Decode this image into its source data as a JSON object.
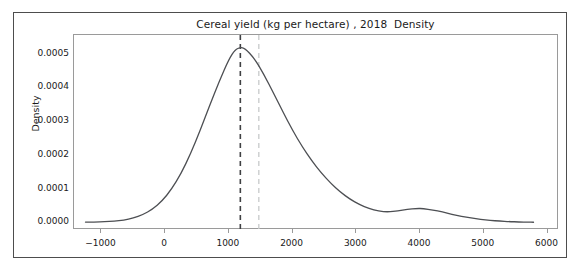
{
  "chart_data": {
    "type": "line",
    "title": "Cereal yield (kg per hectare) , 2018  Density",
    "xlabel": "",
    "ylabel": "Density",
    "grid": false,
    "legend": null,
    "xlim": [
      -1430,
      6180
    ],
    "ylim": [
      -2.15e-05,
      0.000557
    ],
    "xticks": [
      -1000,
      0,
      1000,
      2000,
      3000,
      4000,
      5000,
      6000
    ],
    "xtick_labels": [
      "−1000",
      "0",
      "1000",
      "2000",
      "3000",
      "4000",
      "5000",
      "6000"
    ],
    "yticks": [
      0.0,
      0.0001,
      0.0002,
      0.0003,
      0.0004,
      0.0005
    ],
    "ytick_labels": [
      "0.0000",
      "0.0001",
      "0.0002",
      "0.0003",
      "0.0004",
      "0.0005"
    ],
    "series": [
      {
        "name": "Cereal yield density",
        "color": "#4d4f53",
        "linewidth": 1.3,
        "x": [
          -1250,
          -1100,
          -950,
          -800,
          -650,
          -500,
          -350,
          -200,
          -50,
          100,
          250,
          400,
          550,
          700,
          850,
          1000,
          1100,
          1180,
          1250,
          1400,
          1550,
          1700,
          1850,
          2000,
          2150,
          2300,
          2450,
          2600,
          2750,
          2900,
          3050,
          3200,
          3350,
          3500,
          3650,
          3800,
          3950,
          4050,
          4200,
          4350,
          4500,
          4650,
          4800,
          4950,
          5100,
          5250,
          5400,
          5550,
          5700,
          5780
        ],
        "y": [
          2e-06,
          2.4e-06,
          3.2e-06,
          4.8e-06,
          8e-06,
          1.4e-05,
          2.4e-05,
          4e-05,
          6.4e-05,
          9.9e-05,
          0.000146,
          0.000205,
          0.000274,
          0.000349,
          0.00042,
          0.000485,
          0.000514,
          0.00052,
          0.000518,
          0.000488,
          0.00044,
          0.000385,
          0.000328,
          0.000274,
          0.000226,
          0.000184,
          0.000148,
          0.000117,
          9.1e-05,
          7e-05,
          5.4e-05,
          4.2e-05,
          3.4e-05,
          3.2e-05,
          3.5e-05,
          4e-05,
          4.25e-05,
          4.2e-05,
          3.8e-05,
          3.2e-05,
          2.5e-05,
          1.9e-05,
          1.4e-05,
          1e-05,
          7e-06,
          5e-06,
          3.5e-06,
          2.5e-06,
          1.8e-06,
          1.5e-06
        ]
      }
    ],
    "vlines": [
      {
        "name": "mean-line",
        "x": 1180,
        "color": "#3f4043",
        "style": "dashed",
        "linewidth": 1.6
      },
      {
        "name": "median-line",
        "x": 1470,
        "color": "#c7c9cb",
        "style": "dashed",
        "linewidth": 1.3
      }
    ],
    "annotations": []
  }
}
